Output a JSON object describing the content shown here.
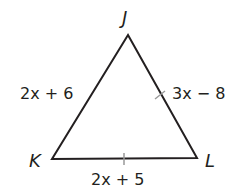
{
  "diagram": {
    "type": "triangle",
    "vertices": {
      "J": {
        "label": "J",
        "x": 128,
        "y": 35
      },
      "K": {
        "label": "K",
        "x": 52,
        "y": 159
      },
      "L": {
        "label": "L",
        "x": 197,
        "y": 158
      }
    },
    "sides": {
      "JK": {
        "expression": "2x + 6",
        "tick_mark": false
      },
      "JL": {
        "expression": "3x − 8",
        "tick_mark": true
      },
      "KL": {
        "expression": "2x + 5",
        "tick_mark": true
      }
    },
    "stroke_color": "#231f20"
  }
}
